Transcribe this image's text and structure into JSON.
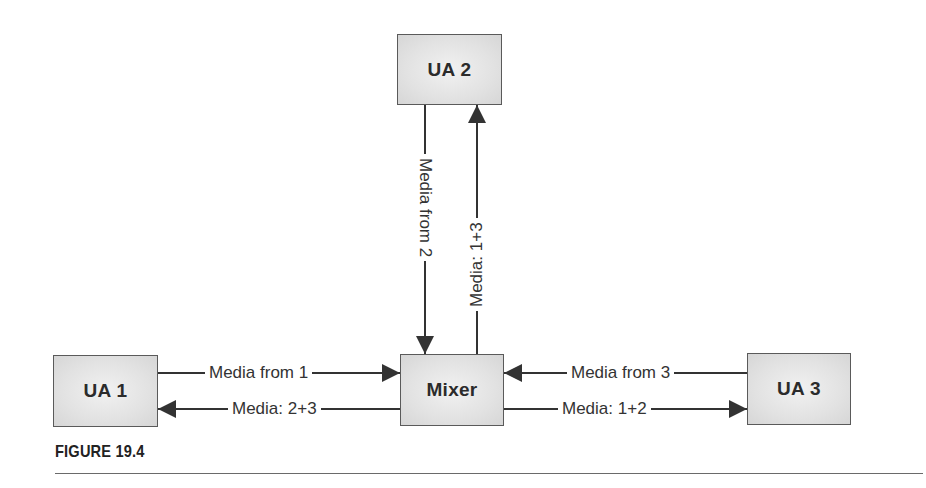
{
  "diagram": {
    "nodes": [
      {
        "id": "ua1",
        "label": "UA 1"
      },
      {
        "id": "ua2",
        "label": "UA 2"
      },
      {
        "id": "ua3",
        "label": "UA 3"
      },
      {
        "id": "mixer",
        "label": "Mixer"
      }
    ],
    "edges": [
      {
        "from": "ua1",
        "to": "mixer",
        "label": "Media from 1"
      },
      {
        "from": "mixer",
        "to": "ua1",
        "label": "Media: 2+3"
      },
      {
        "from": "ua2",
        "to": "mixer",
        "label": "Media from 2"
      },
      {
        "from": "mixer",
        "to": "ua2",
        "label": "Media: 1+3"
      },
      {
        "from": "ua3",
        "to": "mixer",
        "label": "Media from 3"
      },
      {
        "from": "mixer",
        "to": "ua3",
        "label": "Media: 1+2"
      }
    ],
    "colors": {
      "box_fill": "#e2e2e2",
      "box_border": "#5a5a5a",
      "line": "#333333"
    }
  },
  "caption": "FIGURE 19.4"
}
